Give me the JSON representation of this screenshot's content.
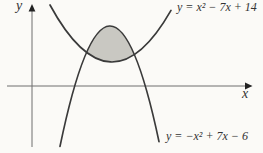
{
  "figure_title": "Region enclosed between two parabolas",
  "colors": {
    "background": "#fbfaf7",
    "curve": "#3a3a3a",
    "axis": "#6e6e6e",
    "arrow": "#222222",
    "shade": "#c9c8c2",
    "text": "#333333"
  },
  "chart_data": {
    "type": "line",
    "title": "",
    "xlabel": "x",
    "ylabel": "y",
    "grid": false,
    "ticks": false,
    "axes": {
      "x_arrow": true,
      "y_arrow": true
    },
    "curves": [
      {
        "label": "y = x² − 7x + 14",
        "coefficients": {
          "a": 1,
          "b": -7,
          "c": 14
        },
        "opens": "up",
        "drawn_x_range_est": [
          -0.8,
          7.9
        ]
      },
      {
        "label": "y = −x² + 7x − 6",
        "coefficients": {
          "a": -1,
          "b": 7,
          "c": -6
        },
        "opens": "down",
        "drawn_x_range_est": [
          -0.7,
          7.5
        ]
      }
    ],
    "shaded_region": {
      "description": "lens-shaped region enclosed between the upper (downward-opening) parabola and the lower (upward-opening) parabola",
      "fill": "#c9c8c2"
    }
  }
}
